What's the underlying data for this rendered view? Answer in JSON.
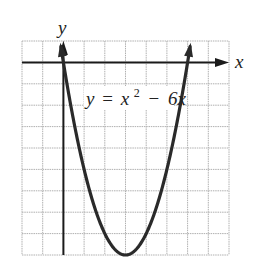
{
  "chart_data": {
    "type": "line",
    "title": "",
    "function": "y = x^2 - 6x",
    "equation_label": {
      "y": "y",
      "eq": "=",
      "x": "x",
      "exp": "2",
      "minus": "−",
      "term": "6x"
    },
    "xlabel": "x",
    "ylabel": "y",
    "xlim": [
      -2,
      8
    ],
    "ylim": [
      -9,
      1
    ],
    "grid": true,
    "grid_step": 1,
    "vertex": [
      3,
      -9
    ],
    "x_intercepts": [
      0,
      6
    ],
    "series": [
      {
        "name": "y = x^2 - 6x",
        "x": [
          -0.15,
          0,
          0.5,
          1,
          1.5,
          2,
          2.5,
          3,
          3.5,
          4,
          4.5,
          5,
          5.5,
          6,
          6.15
        ],
        "y": [
          0.92,
          0,
          -2.75,
          -5,
          -6.75,
          -8,
          -8.75,
          -9,
          -8.75,
          -8,
          -6.75,
          -5,
          -2.75,
          0,
          0.92
        ]
      }
    ],
    "colors": {
      "curve": "#2a2a2a",
      "axes": "#1a1a1a",
      "grid": "#b0b0b0"
    }
  }
}
